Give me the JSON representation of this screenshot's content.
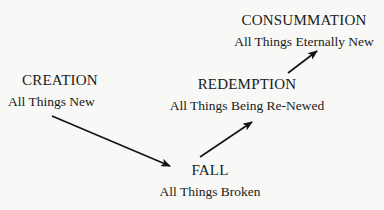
{
  "diagram": {
    "type": "flow",
    "nodes": [
      {
        "id": "creation",
        "title": "CREATION",
        "subtitle": "All Things New"
      },
      {
        "id": "fall",
        "title": "FALL",
        "subtitle": "All Things Broken"
      },
      {
        "id": "redemption",
        "title": "REDEMPTION",
        "subtitle": "All Things Being Re-Newed"
      },
      {
        "id": "consummation",
        "title": "CONSUMMATION",
        "subtitle": "All Things Eternally New"
      }
    ],
    "edges": [
      {
        "from": "creation",
        "to": "fall"
      },
      {
        "from": "fall",
        "to": "redemption"
      },
      {
        "from": "redemption",
        "to": "consummation"
      }
    ]
  },
  "colors": {
    "background": "#f8f8f6",
    "text": "#1a1a1a",
    "arrow": "#111111"
  }
}
